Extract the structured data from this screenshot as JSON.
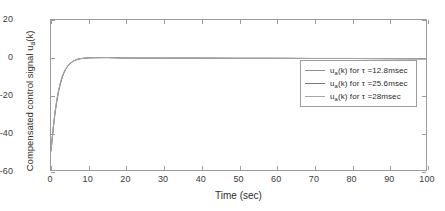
{
  "chart_data": {
    "type": "line",
    "title": "",
    "xlabel": "Time (sec)",
    "ylabel_plain": "Compensated control signal u_a(k)",
    "ylabel_main": "Compensated control signal u",
    "ylabel_sub": "a",
    "ylabel_tail": "(k)",
    "xlim": [
      0,
      100
    ],
    "ylim": [
      -60,
      20
    ],
    "xticks": [
      0,
      10,
      20,
      30,
      40,
      50,
      60,
      70,
      80,
      90,
      100
    ],
    "xticklabels": [
      "0",
      "10",
      "20",
      "30",
      "40",
      "50",
      "60",
      "70",
      "80",
      "90",
      "100"
    ],
    "yticks": [
      20,
      0,
      -20,
      -40,
      -60
    ],
    "yticklabels": [
      "20",
      "0",
      "-20",
      "-40",
      "-60"
    ],
    "grid": false,
    "legend_position": "right-upper-inside",
    "series": [
      {
        "name": "u_a(k) for τ =12.8msec",
        "label_main": "u",
        "label_sub": "a",
        "label_mid": "(k) for ",
        "label_tau": "τ",
        "label_tail": " =12.8msec",
        "color": "#8f8f9a",
        "x": [
          0,
          0.3,
          0.6,
          1,
          1.5,
          2,
          2.5,
          3,
          3.5,
          4,
          4.5,
          5,
          6,
          7,
          8,
          9,
          10,
          12,
          15,
          20,
          30,
          40,
          50,
          60,
          70,
          80,
          90,
          100
        ],
        "y": [
          -50,
          -44,
          -38,
          -31,
          -24,
          -18.5,
          -14,
          -10.6,
          -8,
          -6,
          -4.5,
          -3.4,
          -1.9,
          -1.05,
          -0.6,
          -0.35,
          -0.2,
          -0.1,
          -0.05,
          -0.3,
          -0.3,
          -0.3,
          -0.4,
          -0.4,
          -0.5,
          -0.5,
          -0.6,
          -0.7
        ]
      },
      {
        "name": "u_a(k) for τ =25.6msec",
        "label_main": "u",
        "label_sub": "a",
        "label_mid": "(k) for ",
        "label_tau": "τ",
        "label_tail": " =25.6msec",
        "color": "#77777f",
        "x": [
          0,
          0.3,
          0.6,
          1,
          1.5,
          2,
          2.5,
          3,
          3.5,
          4,
          4.5,
          5,
          6,
          7,
          8,
          9,
          10,
          12,
          15,
          20,
          30,
          40,
          50,
          60,
          70,
          80,
          90,
          100
        ],
        "y": [
          -50,
          -43.5,
          -37.5,
          -30.5,
          -23.5,
          -18,
          -13.6,
          -10.3,
          -7.8,
          -5.9,
          -4.4,
          -3.3,
          -1.85,
          -1.0,
          -0.58,
          -0.33,
          -0.19,
          -0.1,
          -0.05,
          -0.3,
          -0.35,
          -0.35,
          -0.45,
          -0.45,
          -0.55,
          -0.55,
          -0.65,
          -0.75
        ]
      },
      {
        "name": "u_a(k) for τ =28msec",
        "label_main": "u",
        "label_sub": "a",
        "label_mid": "(k) for ",
        "label_tau": "τ",
        "label_tail": " =28msec",
        "color": "#a6a6b0",
        "x": [
          0,
          0.3,
          0.6,
          1,
          1.5,
          2,
          2.5,
          3,
          3.5,
          4,
          4.5,
          5,
          6,
          7,
          8,
          9,
          10,
          12,
          15,
          20,
          30,
          40,
          50,
          60,
          70,
          80,
          90,
          100
        ],
        "y": [
          -50,
          -43,
          -37,
          -30,
          -23,
          -17.6,
          -13.3,
          -10.0,
          -7.6,
          -5.7,
          -4.3,
          -3.2,
          -1.8,
          -0.98,
          -0.55,
          -0.31,
          -0.18,
          -0.09,
          -0.05,
          -0.32,
          -0.32,
          -0.32,
          -0.42,
          -0.42,
          -0.52,
          -0.52,
          -0.62,
          -0.72
        ]
      }
    ],
    "axis_color": "#9a9a9a",
    "text_color": "#2e2e2e"
  }
}
